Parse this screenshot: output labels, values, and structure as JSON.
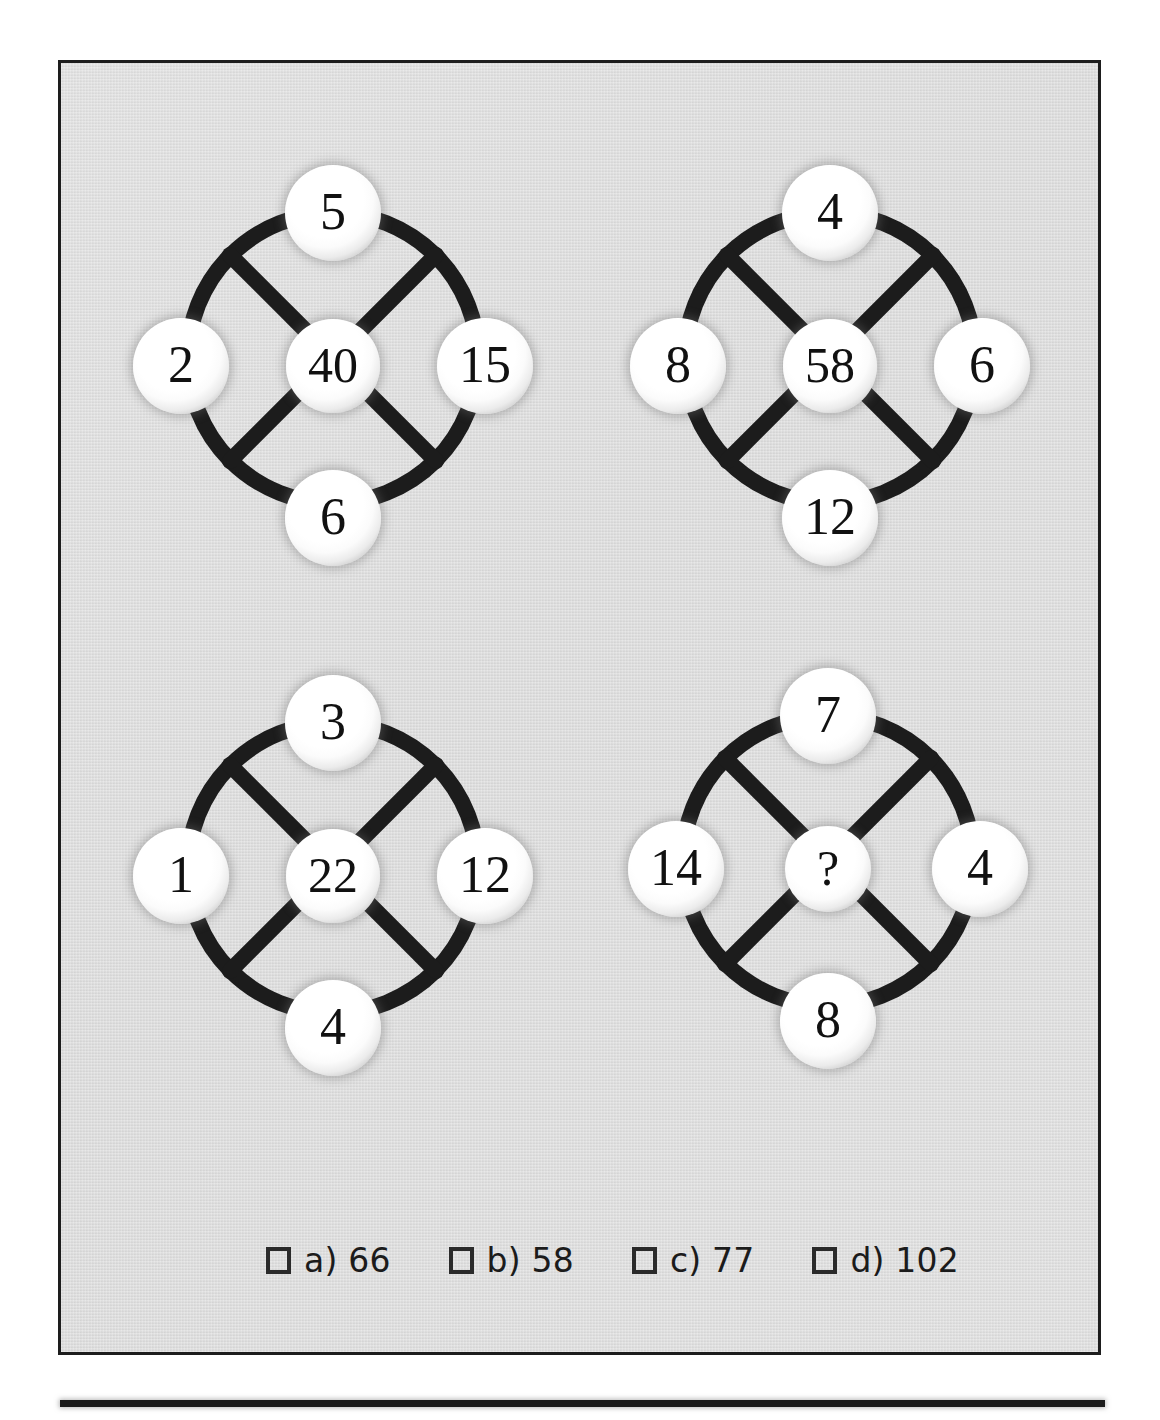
{
  "page": {
    "background_color": "#ffffff",
    "panel_color": "#dcdcdc",
    "ink_color": "#1a1a1a"
  },
  "puzzle": {
    "type": "number-wheel-sequence",
    "unknown_marker": "?",
    "wheels": [
      {
        "name": "wheel-1",
        "top": "5",
        "left": "2",
        "right": "15",
        "bottom": "6",
        "center": "40"
      },
      {
        "name": "wheel-2",
        "top": "4",
        "left": "8",
        "right": "6",
        "bottom": "12",
        "center": "58"
      },
      {
        "name": "wheel-3",
        "top": "3",
        "left": "1",
        "right": "12",
        "bottom": "4",
        "center": "22"
      },
      {
        "name": "wheel-4",
        "top": "7",
        "left": "14",
        "right": "4",
        "bottom": "8",
        "center": "?"
      }
    ]
  },
  "options": [
    {
      "key": "a",
      "label": "a) 66",
      "value": "66"
    },
    {
      "key": "b",
      "label": "b) 58",
      "value": "58"
    },
    {
      "key": "c",
      "label": "c) 77",
      "value": "77"
    },
    {
      "key": "d",
      "label": "d) 102",
      "value": "102"
    }
  ]
}
